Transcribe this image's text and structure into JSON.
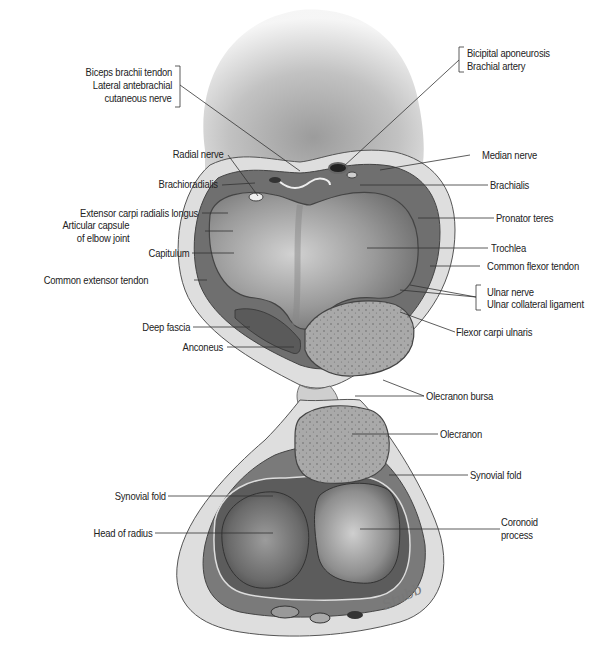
{
  "figure": {
    "colors": {
      "background": "#ffffff",
      "skin": "#c9c9c9",
      "muscle": "#6e6e6e",
      "bone_cartilage": "#9a9a9a",
      "bone_cancellous": "#a8a8a8",
      "fat": "#dcdcdc",
      "leader": "#333333",
      "text": "#222222"
    }
  },
  "labels_left": [
    {
      "id": "biceps",
      "lines": [
        "Biceps brachii tendon",
        "Lateral antebrachial",
        "cutaneous nerve"
      ]
    },
    {
      "id": "radial-nerve",
      "text": "Radial nerve"
    },
    {
      "id": "brachioradialis",
      "text": "Brachioradialis"
    },
    {
      "id": "ecrl",
      "text": "Extensor carpi radialis longus"
    },
    {
      "id": "capsule",
      "lines": [
        "Articular capsule",
        "of elbow joint"
      ]
    },
    {
      "id": "capitulum",
      "text": "Capitulum"
    },
    {
      "id": "common-extensor",
      "text": "Common extensor tendon"
    },
    {
      "id": "deep-fascia",
      "text": "Deep fascia"
    },
    {
      "id": "anconeus",
      "text": "Anconeus"
    },
    {
      "id": "synovial-fold-left",
      "text": "Synovial fold"
    },
    {
      "id": "head-radius",
      "text": "Head of radius"
    }
  ],
  "labels_right": [
    {
      "id": "bicipital",
      "lines": [
        "Bicipital aponeurosis",
        "Brachial artery"
      ]
    },
    {
      "id": "median-nerve",
      "text": "Median nerve"
    },
    {
      "id": "brachialis",
      "text": "Brachialis"
    },
    {
      "id": "pronator",
      "text": "Pronator teres"
    },
    {
      "id": "trochlea",
      "text": "Trochlea"
    },
    {
      "id": "common-flexor",
      "text": "Common flexor tendon"
    },
    {
      "id": "ulnar",
      "lines": [
        "Ulnar nerve",
        "Ulnar collateral ligament"
      ]
    },
    {
      "id": "fcu",
      "text": "Flexor carpi ulnaris"
    },
    {
      "id": "olecranon-bursa",
      "text": "Olecranon bursa"
    },
    {
      "id": "olecranon",
      "text": "Olecranon"
    },
    {
      "id": "synovial-fold-right",
      "text": "Synovial fold"
    },
    {
      "id": "coronoid",
      "lines": [
        "Coronoid",
        "process"
      ]
    }
  ],
  "signature": "Stubb"
}
